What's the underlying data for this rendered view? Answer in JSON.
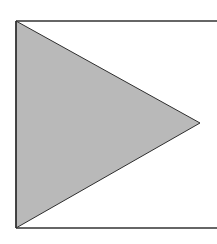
{
  "diagram": {
    "width": 217,
    "height": 244,
    "background": "#ffffff",
    "frame": {
      "left_x": 16,
      "top_y": 21,
      "bottom_y": 228,
      "right_x": 217,
      "stroke": "#333333",
      "stroke_width": 1.6,
      "sides": [
        "left",
        "top",
        "bottom"
      ]
    },
    "triangle": {
      "points": [
        [
          16,
          21
        ],
        [
          200,
          123
        ],
        [
          16,
          228
        ]
      ],
      "fill": "#b9b9b9",
      "stroke": "#2e2e2e",
      "stroke_width": 1,
      "direction": "right"
    }
  }
}
